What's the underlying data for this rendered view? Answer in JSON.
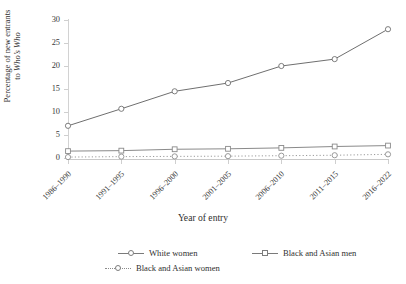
{
  "chart_data": {
    "type": "line",
    "title": "",
    "xlabel": "Year of entry",
    "ylabel_line1": "Percentage of new entrants",
    "ylabel_line2_prefix": "to ",
    "ylabel_line2_italic": "Who’s Who",
    "ylabel_plain": "Percentage of new entrants to Who’s Who",
    "categories": [
      "1986–1990",
      "1991–1995",
      "1996–2000",
      "2001–2005",
      "2006–2010",
      "2011–2015",
      "2016–2022"
    ],
    "ylim": [
      0,
      30
    ],
    "yticks": [
      0,
      5,
      10,
      15,
      20,
      25,
      30
    ],
    "grid": false,
    "legend_position": "bottom",
    "series": [
      {
        "name": "White women",
        "marker": "circle",
        "linestyle": "solid",
        "color": "#6f6f6f",
        "values": [
          7.0,
          10.7,
          14.5,
          16.3,
          20.0,
          21.5,
          28.0
        ]
      },
      {
        "name": "Black and Asian men",
        "marker": "square",
        "linestyle": "solid",
        "color": "#8a8a8a",
        "values": [
          1.5,
          1.6,
          1.9,
          2.0,
          2.2,
          2.5,
          2.7
        ]
      },
      {
        "name": "Black and Asian women",
        "marker": "circle-open",
        "linestyle": "dotted",
        "color": "#8f8f8f",
        "values": [
          0.2,
          0.3,
          0.35,
          0.4,
          0.5,
          0.6,
          0.8
        ]
      }
    ]
  },
  "legend": {
    "items": [
      {
        "label": "White women"
      },
      {
        "label": "Black and Asian men"
      },
      {
        "label": "Black and Asian women"
      }
    ]
  },
  "colors": {
    "axis": "#cfcfcf",
    "text": "#2f2f2f",
    "series_primary": "#6f6f6f",
    "series_secondary": "#8a8a8a",
    "series_tertiary": "#8f8f8f",
    "background": "#ffffff"
  }
}
